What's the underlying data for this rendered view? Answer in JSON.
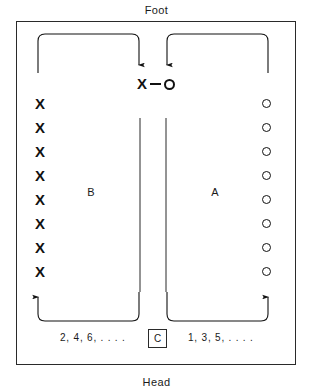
{
  "diagram": {
    "orientation": {
      "top_label": "Foot",
      "bottom_label": "Head"
    },
    "sections": {
      "left": {
        "letter": "B",
        "mark_symbol": "X",
        "mark_count": 8,
        "bed_numbers_label": "2, 4, 6, . . . ."
      },
      "right": {
        "letter": "A",
        "mark_symbol": "O",
        "mark_count": 8,
        "bed_numbers_label": "1, 3, 5, . . . ."
      }
    },
    "center_pair": {
      "left_symbol": "X",
      "connector": "—",
      "right_symbol": "O"
    },
    "station": {
      "label": "C"
    },
    "marks": {
      "x_list": [
        "X",
        "X",
        "X",
        "X",
        "X",
        "X",
        "X",
        "X"
      ],
      "o_list": [
        "O",
        "O",
        "O",
        "O",
        "O",
        "O",
        "O",
        "O"
      ]
    },
    "colors": {
      "ink": "#111111",
      "border": "#2a2a2a",
      "background": "#ffffff"
    }
  }
}
